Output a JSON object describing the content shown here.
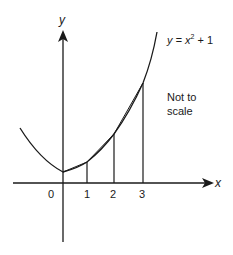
{
  "diagram": {
    "equation": {
      "prefix": "y = x",
      "exp": "2",
      "suffix": " + 1"
    },
    "note_line1": "Not to",
    "note_line2": "scale",
    "x_axis_label": "x",
    "y_axis_label": "y",
    "ticks": [
      "0",
      "1",
      "2",
      "3"
    ],
    "colors": {
      "stroke": "#1a1a1a",
      "background": "#ffffff"
    }
  }
}
